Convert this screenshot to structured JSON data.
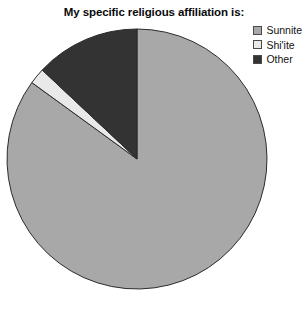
{
  "chart_data": {
    "type": "pie",
    "title": "My specific religious affiliation is:",
    "categories": [
      "Sunnite",
      "Shi'ite",
      "Other"
    ],
    "values": [
      85,
      2,
      13
    ],
    "unit": "percent",
    "start_angle": 0,
    "direction": "clockwise",
    "colors": [
      "#a8a8a8",
      "#e9e9e9",
      "#333333"
    ],
    "legend": {
      "position": "top-right",
      "entries": [
        {
          "label": "Sunnite",
          "color": "#a8a8a8"
        },
        {
          "label": "Shi'ite",
          "color": "#e9e9e9"
        },
        {
          "label": "Other",
          "color": "#333333"
        }
      ]
    },
    "xlabel": "",
    "ylabel": "",
    "grid": false,
    "geometry": {
      "center_x": 131,
      "center_y": 131,
      "radius": 130
    }
  },
  "style": {
    "background": "#ffffff",
    "stroke": "#2b2b2b",
    "title_color": "#0a0a0a"
  }
}
